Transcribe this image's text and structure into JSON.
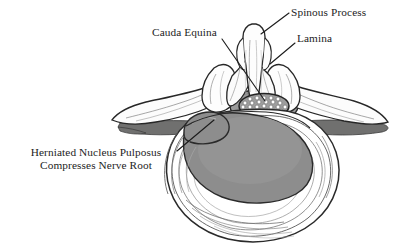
{
  "figure": {
    "background_color": "#ffffff",
    "width": 400,
    "height": 250
  },
  "labels": [
    {
      "id": "spinous-process",
      "text": "Spinous Process",
      "leader": "down-left to spinous process tip"
    },
    {
      "id": "cauda-equina",
      "text": "Cauda Equina",
      "leader": "down-right to dotted oval in spinal canal"
    },
    {
      "id": "lamina",
      "text": "Lamina",
      "leader": "down-left to lamina ridge"
    },
    {
      "id": "herniated-nucleus-pulposus",
      "line1": "Herniated Nucleus Pulposus",
      "line2": "Compresses Nerve Root",
      "leader": "up-right to herniation bulge apex"
    }
  ],
  "structures": [
    {
      "name": "spinous-process",
      "fill": "#fdfdfd"
    },
    {
      "name": "lamina-left",
      "fill": "#fbfbfb"
    },
    {
      "name": "lamina-right",
      "fill": "#fbfbfb"
    },
    {
      "name": "transverse-process-left",
      "fill": "#fcfcfc"
    },
    {
      "name": "transverse-process-right",
      "fill": "#fcfcfc"
    },
    {
      "name": "shadow-wing-left",
      "fill": "#70706f"
    },
    {
      "name": "shadow-wing-right",
      "fill": "#70706f"
    },
    {
      "name": "spinal-canal",
      "fill": "#9a9a9a"
    },
    {
      "name": "cauda-equina-oval",
      "fill": "#9d9d9d"
    },
    {
      "name": "nerve-rootlets",
      "fill": "#ffffff",
      "count": 27
    },
    {
      "name": "vertebral-body",
      "fill": "#ffffff"
    },
    {
      "name": "annulus-fibrosus",
      "fill": "#ffffff"
    },
    {
      "name": "nucleus-pulposus",
      "fill": "#8d8d8d"
    },
    {
      "name": "herniation-bulge",
      "fill": "#8d8d8d"
    }
  ],
  "colors": {
    "ink": "#1d1d1d",
    "outline": "#2a2a2a",
    "hairline": "#6a6a6a",
    "bone_fill": "#fdfdfd",
    "shadow_gray": "#70706f",
    "canal_gray": "#9a9a9a",
    "nucleus_gray": "#8d8d8d",
    "background": "#ffffff"
  }
}
